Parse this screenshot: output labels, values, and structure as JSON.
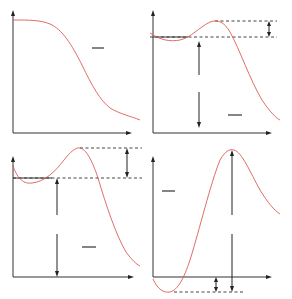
{
  "figure": {
    "curve_color": "#d9534f",
    "axis_color": "#333333",
    "panels": [
      {
        "id": "top-left",
        "type": "monotonic lowpass response (Butterworth-like)",
        "label": "—",
        "features": [
          "flat passband",
          "smooth monotonic rolloff"
        ]
      },
      {
        "id": "top-right",
        "type": "passband ripple response (Chebyshev-like)",
        "label": "—",
        "features": [
          "ripple band between two dashed levels",
          "double arrow marking ripple height",
          "double arrow marking passband level"
        ]
      },
      {
        "id": "bottom-left",
        "type": "passband ripple response with overshoot",
        "label": "—",
        "features": [
          "ripple band between two dashed levels",
          "double arrow marking ripple height",
          "double arrow marking passband level"
        ]
      },
      {
        "id": "bottom-right",
        "type": "response with undershoot below zero and large peak",
        "label": "—",
        "features": [
          "undershoot below baseline",
          "dashed minimum level",
          "double arrow marking peak height",
          "double arrow marking undershoot depth"
        ]
      }
    ]
  }
}
